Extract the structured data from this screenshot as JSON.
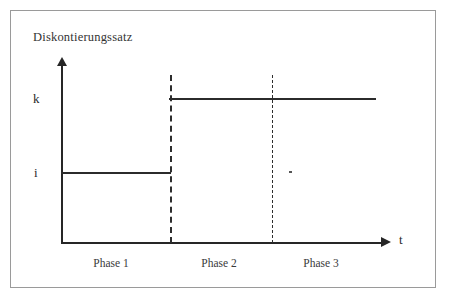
{
  "chart_data": {
    "type": "line",
    "title": "Diskontierungssatz",
    "xlabel": "t",
    "ylabel": "Diskontierungssatz",
    "grid": false,
    "legend": "none",
    "y_tick_labels": [
      "i",
      "k"
    ],
    "x_tick_labels": [],
    "annotations": [
      "Phase 1",
      "Phase 2",
      "Phase 3"
    ],
    "categories": [
      "Phase 1",
      "Phase 2",
      "Phase 3"
    ],
    "values": [
      "i",
      "k",
      "k"
    ],
    "series": [
      {
        "name": "Diskontierungssatz",
        "step": "post",
        "points": [
          {
            "phase": "Phase 1",
            "level": "i"
          },
          {
            "phase": "Phase 2",
            "level": "k"
          },
          {
            "phase": "Phase 3",
            "level": "k"
          }
        ]
      }
    ],
    "phase_boundaries": [
      "Phase 1 / Phase 2",
      "Phase 2 / Phase 3"
    ]
  },
  "chart": {
    "title": "Diskontierungssatz",
    "y_axis": {
      "name": "discount-rate-axis",
      "labels": {
        "high": "k",
        "low": "i"
      }
    },
    "x_axis": {
      "name": "time-axis",
      "label": "t"
    },
    "phases": [
      {
        "label": "Phase 1",
        "level": "i"
      },
      {
        "label": "Phase 2",
        "level": "k"
      },
      {
        "label": "Phase 3",
        "level": "k"
      }
    ]
  },
  "colors": {
    "ink": "#2b2b2b",
    "axis": "#262626",
    "frame": "#9a9a9a",
    "background": "#ffffff",
    "divider": "#2d2d2d"
  }
}
